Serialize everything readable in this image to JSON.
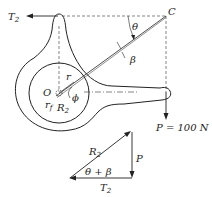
{
  "diagram": {
    "labels": {
      "T2": "T",
      "T2_sub": "2",
      "C": "C",
      "theta": "θ",
      "beta": "β",
      "O": "O",
      "r": "r",
      "rf": "r",
      "rf_sub": "f",
      "phi": "ϕ",
      "R2": "R",
      "R2_sub": "2",
      "P_eq": "P = 100 N",
      "tri_R2": "R",
      "tri_R2_sub": "2",
      "tri_P": "P",
      "tri_angle": "θ + β",
      "tri_T2": "T",
      "tri_T2_sub": "2"
    },
    "colors": {
      "ink": "#222222",
      "background": "#ffffff"
    }
  }
}
